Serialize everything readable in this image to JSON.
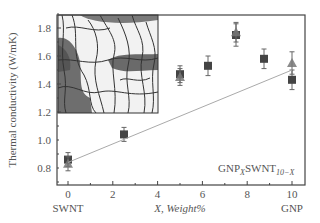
{
  "chart_data": {
    "type": "scatter",
    "title": "",
    "xlabel": "X, Weight%",
    "ylabel": "Thermal conductivity (W/mK)",
    "xlim": [
      -0.5,
      10.5
    ],
    "ylim": [
      0.7,
      1.9
    ],
    "x_ticks": [
      0,
      2,
      4,
      6,
      8,
      10
    ],
    "y_ticks": [
      0.8,
      1.0,
      1.2,
      1.4,
      1.6,
      1.8
    ],
    "x_tick_labels": [
      "0",
      "2",
      "4",
      "6",
      "8",
      "10"
    ],
    "y_tick_labels": [
      "0.8",
      "1.0",
      "1.2",
      "1.4",
      "1.6",
      "1.8"
    ],
    "x_end_labels": {
      "left": "SWNT",
      "right": "GNP"
    },
    "grid": false,
    "series": [
      {
        "name": "measured (square)",
        "marker": "square",
        "color": "#444444",
        "x": [
          0,
          2.5,
          5,
          6.25,
          7.5,
          8.75,
          10
        ],
        "values": [
          0.86,
          1.04,
          1.47,
          1.53,
          1.75,
          1.58,
          1.43
        ],
        "error": [
          0.05,
          0.05,
          0.06,
          0.07,
          0.08,
          0.07,
          0.07
        ]
      },
      {
        "name": "measured (triangle)",
        "marker": "triangle",
        "color": "#777777",
        "x": [
          0,
          5,
          7.5,
          10
        ],
        "values": [
          0.83,
          1.45,
          1.77,
          1.55
        ],
        "error": [
          0.05,
          0.06,
          0.07,
          0.08
        ]
      },
      {
        "name": "linear mixing",
        "type": "line",
        "style": "dotted",
        "color": "#aaaaaa",
        "x": [
          0,
          10
        ],
        "values": [
          0.84,
          1.5
        ]
      }
    ],
    "annotations": [
      {
        "text": "GNP",
        "sub1": "X",
        "text2": "SWNT",
        "sub2": "10−X",
        "position": "lower-right"
      }
    ],
    "inset": {
      "description": "micrograph of graphene platelets and nanotubes",
      "position": "upper-left"
    }
  },
  "labels": {
    "ylabel": "Thermal conductivity (W/mK)",
    "xlabel": "X, Weight%",
    "x_left": "SWNT",
    "x_right": "GNP",
    "annot_a": "GNP",
    "annot_a_sub": "X",
    "annot_b": "SWNT",
    "annot_b_sub": "10−X"
  }
}
